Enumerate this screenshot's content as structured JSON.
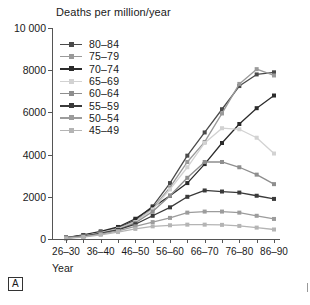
{
  "chart_data": {
    "type": "line",
    "title": "Deaths per million/year",
    "xlabel": "Year",
    "ylabel": "",
    "ylim": [
      0,
      10000
    ],
    "ytick_labels": [
      "0",
      "2000",
      "4000",
      "6000",
      "8000",
      "10 000"
    ],
    "ytick_values": [
      0,
      2000,
      4000,
      6000,
      8000,
      10000
    ],
    "grid": false,
    "legend_position": "top-left",
    "categories": [
      "26-30",
      "31-35",
      "36-40",
      "41-45",
      "46-50",
      "51-55",
      "56-60",
      "61-65",
      "66-70",
      "71-75",
      "76-80",
      "81-85",
      "86-90"
    ],
    "xtick_labels_visible": [
      "26-30",
      "36-40",
      "46-50",
      "56-60",
      "66-70",
      "76-80",
      "86-90"
    ],
    "series": [
      {
        "name": "80-84",
        "color": "#4a4a4a",
        "values": [
          60,
          170,
          330,
          530,
          900,
          1550,
          2650,
          3950,
          5050,
          6150,
          7250,
          7800,
          7900
        ]
      },
      {
        "name": "75-79",
        "color": "#9a9a9a",
        "values": [
          55,
          160,
          310,
          500,
          830,
          1450,
          2450,
          3650,
          4600,
          5950,
          7350,
          8050,
          7750
        ]
      },
      {
        "name": "70-74",
        "color": "#2b2b2b",
        "values": [
          70,
          190,
          360,
          570,
          960,
          1500,
          2050,
          2650,
          3550,
          4550,
          5450,
          6200,
          6800
        ]
      },
      {
        "name": "65-69",
        "color": "#d2d2d2",
        "values": [
          50,
          150,
          300,
          480,
          800,
          1400,
          2350,
          3400,
          4550,
          5250,
          5200,
          4800,
          4050
        ]
      },
      {
        "name": "60-64",
        "color": "#8e8e8e",
        "values": [
          45,
          140,
          280,
          450,
          760,
          1300,
          2050,
          2900,
          3650,
          3650,
          3400,
          3050,
          2600
        ]
      },
      {
        "name": "55-59",
        "color": "#3a3a3a",
        "values": [
          40,
          130,
          260,
          430,
          700,
          1100,
          1500,
          2000,
          2300,
          2250,
          2200,
          2050,
          1900
        ]
      },
      {
        "name": "50-54",
        "color": "#9c9c9c",
        "values": [
          35,
          110,
          230,
          380,
          600,
          800,
          1000,
          1250,
          1300,
          1300,
          1250,
          1100,
          950
        ]
      },
      {
        "name": "45-49",
        "color": "#b4b4b4",
        "values": [
          30,
          95,
          200,
          330,
          480,
          600,
          650,
          680,
          680,
          670,
          620,
          540,
          450
        ]
      }
    ]
  },
  "panel": {
    "tag": "A"
  }
}
